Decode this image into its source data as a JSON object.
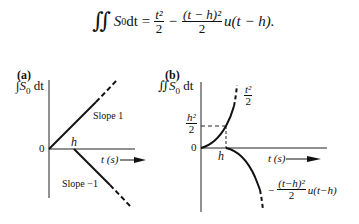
{
  "equation": {
    "lhs_integral": "∬",
    "lhs_body": "S",
    "lhs_sub": "0",
    "lhs_dt": " dt =",
    "term1_num": "t²",
    "term1_den": "2",
    "minus": "−",
    "term2_num": "(t − h)²",
    "term2_den": "2",
    "term2_tail": "u(t − h)."
  },
  "panel_a": {
    "label": "(a)",
    "ylabel_integral": "∫",
    "ylabel_body": "S",
    "ylabel_sub": "0",
    "ylabel_dt": " dt",
    "origin_label": "0",
    "h_label": "h",
    "xlabel": "t (s)",
    "slope_up_label": "Slope 1",
    "slope_down_label": "Slope −1"
  },
  "panel_b": {
    "label": "(b)",
    "ylabel_integral": "∬",
    "ylabel_body": "S",
    "ylabel_sub": "0",
    "ylabel_dt": " dt",
    "origin_label": "0",
    "h_label": "h",
    "xlabel": "t (s)",
    "yvalue_num": "h²",
    "yvalue_den": "2",
    "curve_up_num": "t²",
    "curve_up_den": "2",
    "curve_down_minus": "−",
    "curve_down_num": "(t−h)²",
    "curve_down_den": "2",
    "curve_down_tail": "u(t−h)"
  }
}
